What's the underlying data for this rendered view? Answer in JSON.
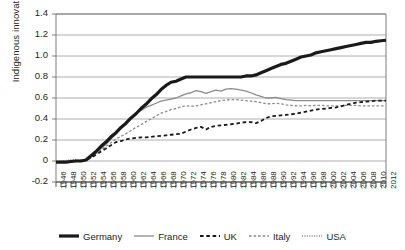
{
  "chart_data": {
    "type": "line",
    "title": "",
    "xlabel": "",
    "ylabel": "Indigenous innovation",
    "ylim": [
      -0.2,
      1.4
    ],
    "ytick_labels": [
      "1.4",
      "1.2",
      "1.0",
      "0.8",
      "0.6",
      "0.4",
      "0.2",
      "0",
      "-0.2"
    ],
    "ytick_values": [
      1.4,
      1.2,
      1.0,
      0.8,
      0.6,
      0.4,
      0.2,
      0,
      -0.2
    ],
    "xlim": [
      1946,
      2012
    ],
    "grid": "horizontal",
    "legend_position": "bottom",
    "x": [
      1946,
      1947,
      1948,
      1949,
      1950,
      1951,
      1952,
      1953,
      1954,
      1955,
      1956,
      1957,
      1958,
      1959,
      1960,
      1961,
      1962,
      1963,
      1964,
      1965,
      1966,
      1967,
      1968,
      1969,
      1970,
      1971,
      1972,
      1973,
      1974,
      1975,
      1976,
      1977,
      1978,
      1979,
      1980,
      1981,
      1982,
      1983,
      1984,
      1985,
      1986,
      1987,
      1988,
      1989,
      1990,
      1991,
      1992,
      1993,
      1994,
      1995,
      1996,
      1997,
      1998,
      1999,
      2000,
      2001,
      2002,
      2003,
      2004,
      2005,
      2006,
      2007,
      2008,
      2009,
      2010,
      2011,
      2012
    ],
    "xtick_labels": [
      "1946",
      "1948",
      "1950",
      "1952",
      "1954",
      "1956",
      "1958",
      "1960",
      "1962",
      "1964",
      "1966",
      "1968",
      "1970",
      "1972",
      "1974",
      "1976",
      "1978",
      "1980",
      "1982",
      "1984",
      "1986",
      "1988",
      "1990",
      "1992",
      "1994",
      "1996",
      "1998",
      "2000",
      "2002",
      "2004",
      "2006",
      "2008",
      "2010",
      "2012"
    ],
    "series": [
      {
        "name": "Germany",
        "color": "#1a1a1a",
        "style": "solid",
        "width": 3.2,
        "values": [
          -0.01,
          -0.01,
          -0.01,
          -0.005,
          0.0,
          0.0,
          0.01,
          0.05,
          0.09,
          0.14,
          0.18,
          0.23,
          0.27,
          0.32,
          0.36,
          0.41,
          0.45,
          0.5,
          0.54,
          0.59,
          0.63,
          0.68,
          0.72,
          0.75,
          0.76,
          0.78,
          0.8,
          0.8,
          0.8,
          0.8,
          0.8,
          0.8,
          0.8,
          0.8,
          0.8,
          0.8,
          0.8,
          0.8,
          0.81,
          0.81,
          0.82,
          0.84,
          0.86,
          0.88,
          0.9,
          0.92,
          0.93,
          0.95,
          0.97,
          0.99,
          1.0,
          1.01,
          1.03,
          1.04,
          1.05,
          1.06,
          1.07,
          1.08,
          1.09,
          1.1,
          1.11,
          1.12,
          1.13,
          1.13,
          1.14,
          1.145,
          1.15
        ]
      },
      {
        "name": "France",
        "color": "#8c8c8c",
        "style": "solid",
        "width": 1.3,
        "values": [
          -0.01,
          -0.01,
          -0.01,
          -0.005,
          0.0,
          0.0,
          0.01,
          0.04,
          0.08,
          0.12,
          0.16,
          0.21,
          0.26,
          0.31,
          0.37,
          0.41,
          0.46,
          0.48,
          0.51,
          0.53,
          0.55,
          0.57,
          0.58,
          0.59,
          0.6,
          0.62,
          0.64,
          0.65,
          0.67,
          0.66,
          0.645,
          0.66,
          0.675,
          0.665,
          0.685,
          0.69,
          0.685,
          0.675,
          0.665,
          0.65,
          0.63,
          0.615,
          0.6,
          0.6,
          0.605,
          0.595,
          0.585,
          0.58,
          0.575,
          0.575,
          0.575,
          0.575,
          0.575,
          0.575,
          0.575,
          0.575,
          0.575,
          0.575,
          0.575,
          0.575,
          0.575,
          0.575,
          0.575,
          0.575,
          0.575,
          0.575,
          0.575
        ]
      },
      {
        "name": "UK",
        "color": "#1a1a1a",
        "style": "dashed",
        "width": 1.8,
        "values": [
          -0.01,
          -0.01,
          -0.01,
          -0.005,
          0.0,
          0.0,
          0.01,
          0.03,
          0.06,
          0.09,
          0.12,
          0.15,
          0.18,
          0.19,
          0.205,
          0.215,
          0.22,
          0.225,
          0.225,
          0.23,
          0.235,
          0.24,
          0.245,
          0.25,
          0.255,
          0.26,
          0.28,
          0.3,
          0.315,
          0.325,
          0.3,
          0.325,
          0.335,
          0.34,
          0.345,
          0.35,
          0.355,
          0.365,
          0.37,
          0.37,
          0.36,
          0.38,
          0.41,
          0.425,
          0.43,
          0.435,
          0.44,
          0.445,
          0.45,
          0.46,
          0.47,
          0.48,
          0.49,
          0.495,
          0.5,
          0.505,
          0.51,
          0.52,
          0.535,
          0.545,
          0.555,
          0.56,
          0.565,
          0.57,
          0.575,
          0.575,
          0.575
        ]
      },
      {
        "name": "Italy",
        "color": "#8c8c8c",
        "style": "dashed",
        "width": 1.3,
        "values": [
          -0.01,
          -0.01,
          -0.01,
          -0.005,
          0.0,
          0.0,
          0.01,
          0.035,
          0.07,
          0.105,
          0.14,
          0.175,
          0.21,
          0.235,
          0.26,
          0.29,
          0.32,
          0.345,
          0.375,
          0.4,
          0.43,
          0.455,
          0.47,
          0.49,
          0.5,
          0.515,
          0.525,
          0.52,
          0.525,
          0.535,
          0.545,
          0.555,
          0.565,
          0.575,
          0.58,
          0.585,
          0.585,
          0.58,
          0.575,
          0.57,
          0.565,
          0.555,
          0.545,
          0.545,
          0.55,
          0.545,
          0.535,
          0.53,
          0.525,
          0.525,
          0.53,
          0.525,
          0.53,
          0.53,
          0.525,
          0.525,
          0.525,
          0.525,
          0.53,
          0.53,
          0.53,
          0.525,
          0.525,
          0.525,
          0.525,
          0.525,
          0.525
        ]
      },
      {
        "name": "USA",
        "color": "#8c8c8c",
        "style": "dotted",
        "width": 1.3,
        "values": [
          -0.005,
          0.0,
          0.005,
          0.01,
          0.015,
          0.01,
          0.015,
          0.05,
          0.09,
          0.14,
          0.18,
          0.23,
          0.27,
          0.32,
          0.36,
          0.41,
          0.45,
          0.5,
          0.54,
          0.59,
          0.63,
          0.68,
          0.72,
          0.755,
          0.765,
          0.785,
          0.8,
          0.8,
          0.8,
          0.8,
          0.8,
          0.8,
          0.8,
          0.8,
          0.8,
          0.8,
          0.8,
          0.8,
          0.81,
          0.81,
          0.82,
          0.84,
          0.86,
          0.88,
          0.9,
          0.92,
          0.93,
          0.95,
          0.97,
          0.99,
          1.0,
          1.01,
          1.03,
          1.04,
          1.05,
          1.06,
          1.07,
          1.08,
          1.09,
          1.1,
          1.11,
          1.12,
          1.13,
          1.13,
          1.14,
          1.145,
          1.15
        ]
      }
    ]
  },
  "legend": {
    "items": [
      {
        "label": "Germany"
      },
      {
        "label": "France"
      },
      {
        "label": "UK"
      },
      {
        "label": "Italy"
      },
      {
        "label": "USA"
      }
    ]
  }
}
